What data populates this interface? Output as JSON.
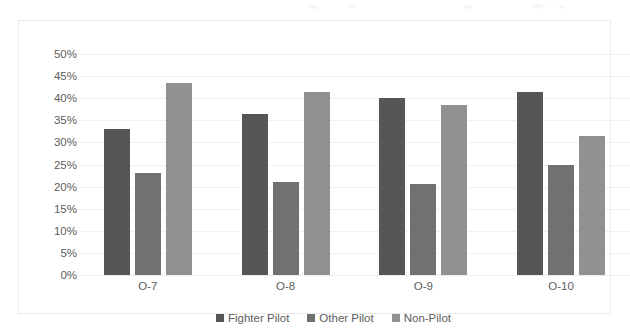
{
  "chart_data": {
    "type": "bar",
    "title": "",
    "xlabel": "",
    "ylabel": "",
    "categories": [
      "O-7",
      "O-8",
      "O-9",
      "O-10"
    ],
    "series": [
      {
        "name": "Fighter Pilot",
        "color": "#565656",
        "values": [
          33.0,
          36.5,
          40.0,
          41.5
        ]
      },
      {
        "name": "Other Pilot",
        "color": "#717171",
        "values": [
          23.0,
          21.0,
          20.5,
          25.0
        ]
      },
      {
        "name": "Non-Pilot",
        "color": "#919191",
        "values": [
          43.5,
          41.5,
          38.5,
          31.5
        ]
      }
    ],
    "ylim": [
      0,
      50
    ],
    "ytick_step": 5,
    "ytick_labels": [
      "50%",
      "45%",
      "40%",
      "35%",
      "30%",
      "25%",
      "20%",
      "15%",
      "10%",
      "5%",
      "0%"
    ],
    "grid": true,
    "legend_position": "bottom",
    "value_suffix": "%"
  },
  "figure": {
    "border_color": "#ebebeb",
    "gridline_color": "#f0f0f0",
    "background": "#ffffff",
    "text_color": "#5d5d5d"
  }
}
